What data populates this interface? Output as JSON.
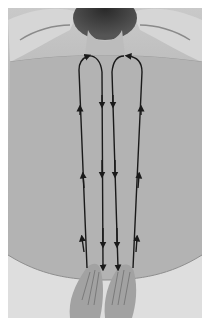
{
  "image": {
    "subject": "back-massage-stroke-diagram",
    "description": "Photograph of a person's bare back lying face down, hands of the massage therapist placed at the lower back, with four vertical arrow strokes drawn along either side of the spine, looping over the shoulders",
    "colors": {
      "border": "#ffffff",
      "skin_light": "#c8c8c8",
      "skin_mid": "#b2b2b2",
      "hair": "#3a3a3a",
      "arrow": "#1a1a1a",
      "sheet": "#e2e2e2"
    },
    "strokes": [
      {
        "side": "left",
        "direction": "up",
        "path": "outer line rising from lower back to shoulder"
      },
      {
        "side": "left",
        "direction": "down",
        "path": "inner line descending from shoulder loop to lower back"
      },
      {
        "side": "right",
        "direction": "down",
        "path": "inner line descending from shoulder loop to lower back"
      },
      {
        "side": "right",
        "direction": "up",
        "path": "outer line rising from lower back to shoulder"
      }
    ]
  }
}
